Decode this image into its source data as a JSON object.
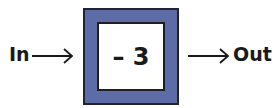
{
  "diagram": {
    "type": "function-machine",
    "input_label": "In",
    "output_label": "Out",
    "operation": "– 3",
    "colors": {
      "frame_fill": "#5d6ba6",
      "frame_border": "#23232e",
      "inner_fill": "#ffffff",
      "text": "#1a1a1a"
    }
  }
}
